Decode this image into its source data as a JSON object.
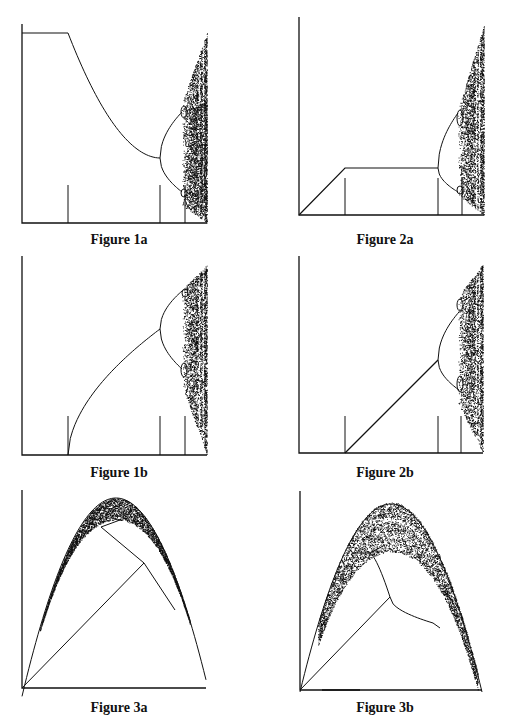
{
  "page": {
    "background": "#ffffff",
    "ink": "#111111",
    "width": 505,
    "height": 728
  },
  "figures": [
    {
      "id": "1a",
      "caption": "Figure 1a",
      "caption_pos": [
        119,
        246
      ],
      "axes": {
        "origin": [
          22,
          223
        ],
        "x_end": 207,
        "y_top": 24
      },
      "ticks": {
        "x": [
          68,
          160,
          185
        ],
        "top": 185
      },
      "description": "Bifurcation diagram: flat plateau then decaying branch, period-doubling cascade into chaos"
    },
    {
      "id": "2a",
      "caption": "Figure 2a",
      "caption_pos": [
        385,
        246
      ],
      "axes": {
        "origin": [
          299,
          215
        ],
        "x_end": 484,
        "y_top": 17
      },
      "ticks": {
        "x": [
          345,
          438,
          462
        ],
        "top": 178
      },
      "description": "Bifurcation diagram: linear ramp, plateau, then period-doubling cascade into chaos"
    },
    {
      "id": "1b",
      "caption": "Figure 1b",
      "caption_pos": [
        119,
        479
      ],
      "axes": {
        "origin": [
          22,
          455
        ],
        "x_end": 207,
        "y_top": 256
      },
      "ticks": {
        "x": [
          68,
          160,
          185
        ],
        "top": 416
      },
      "description": "Bifurcation diagram: rising branch from threshold, period-doubling cascade into chaos"
    },
    {
      "id": "2b",
      "caption": "Figure 2b",
      "caption_pos": [
        385,
        479
      ],
      "axes": {
        "origin": [
          299,
          453
        ],
        "x_end": 483,
        "y_top": 256
      },
      "ticks": {
        "x": [
          345,
          438,
          461
        ],
        "top": 416
      },
      "description": "Bifurcation diagram: linear branch from threshold, period-doubling cascade into chaos"
    },
    {
      "id": "3a",
      "caption": "Figure 3a",
      "caption_pos": [
        119,
        714
      ],
      "axes": {
        "origin": [
          22,
          688
        ],
        "x_end": 206,
        "y_top": 490
      },
      "description": "Parabolic attractor with chaotic band near peak; fixed-point and period-2 branches"
    },
    {
      "id": "3b",
      "caption": "Figure 3b",
      "caption_pos": [
        385,
        714
      ],
      "axes": {
        "origin": [
          300,
          690
        ],
        "x_end": 482,
        "y_top": 491
      },
      "description": "Parabolic attractor with wide chaotic band; fixed-point and period-2 branches"
    }
  ],
  "chart_data": [
    {
      "type": "scatter",
      "title": "Figure 1a",
      "xlabel": "",
      "ylabel": "",
      "tick_marks": 3,
      "grid": false
    },
    {
      "type": "scatter",
      "title": "Figure 2a",
      "xlabel": "",
      "ylabel": "",
      "tick_marks": 3,
      "grid": false
    },
    {
      "type": "scatter",
      "title": "Figure 1b",
      "xlabel": "",
      "ylabel": "",
      "tick_marks": 3,
      "grid": false
    },
    {
      "type": "scatter",
      "title": "Figure 2b",
      "xlabel": "",
      "ylabel": "",
      "tick_marks": 3,
      "grid": false
    },
    {
      "type": "scatter",
      "title": "Figure 3a",
      "xlabel": "",
      "ylabel": "",
      "grid": false
    },
    {
      "type": "scatter",
      "title": "Figure 3b",
      "xlabel": "",
      "ylabel": "",
      "grid": false
    }
  ]
}
